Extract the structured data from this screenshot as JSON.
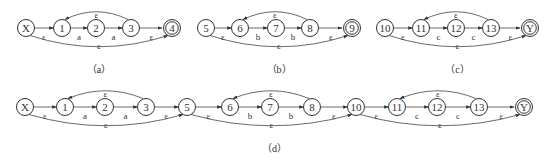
{
  "figure": {
    "panels": [
      {
        "id": "a",
        "caption": "（a）",
        "nodes": [
          {
            "label": "X",
            "x": 26,
            "y": 28,
            "accept": false
          },
          {
            "label": "1",
            "x": 62,
            "y": 28,
            "accept": false
          },
          {
            "label": "2",
            "x": 96,
            "y": 28,
            "accept": false
          },
          {
            "label": "3",
            "x": 131,
            "y": 28,
            "accept": false
          },
          {
            "label": "4",
            "x": 172,
            "y": 28,
            "accept": true
          }
        ],
        "edges": [
          {
            "from": 0,
            "to": 1,
            "label": "ε"
          },
          {
            "from": 1,
            "to": 2,
            "label": "a"
          },
          {
            "from": 2,
            "to": 3,
            "label": "a"
          },
          {
            "from": 3,
            "to": 4,
            "label": "ε"
          }
        ],
        "back_edge": {
          "from": 3,
          "to": 1,
          "label": "ε"
        },
        "skip_edge": {
          "from": 0,
          "to": 4,
          "label": "ε"
        }
      },
      {
        "id": "b",
        "caption": "（b）",
        "nodes": [
          {
            "label": "5",
            "x": 206,
            "y": 28,
            "accept": false
          },
          {
            "label": "6",
            "x": 240,
            "y": 28,
            "accept": false
          },
          {
            "label": "7",
            "x": 276,
            "y": 28,
            "accept": false
          },
          {
            "label": "8",
            "x": 310,
            "y": 28,
            "accept": false
          },
          {
            "label": "9",
            "x": 352,
            "y": 28,
            "accept": true
          }
        ],
        "edges": [
          {
            "from": 0,
            "to": 1,
            "label": "ε"
          },
          {
            "from": 1,
            "to": 2,
            "label": "b"
          },
          {
            "from": 2,
            "to": 3,
            "label": "b"
          },
          {
            "from": 3,
            "to": 4,
            "label": "ε"
          }
        ],
        "back_edge": {
          "from": 3,
          "to": 1,
          "label": "ε"
        },
        "skip_edge": {
          "from": 0,
          "to": 4,
          "label": "ε"
        }
      },
      {
        "id": "c",
        "caption": "（c）",
        "nodes": [
          {
            "label": "10",
            "x": 385,
            "y": 28,
            "accept": false
          },
          {
            "label": "11",
            "x": 421,
            "y": 28,
            "accept": false
          },
          {
            "label": "12",
            "x": 456,
            "y": 28,
            "accept": false
          },
          {
            "label": "13",
            "x": 491,
            "y": 28,
            "accept": false
          },
          {
            "label": "Y",
            "x": 530,
            "y": 28,
            "accept": true
          }
        ],
        "edges": [
          {
            "from": 0,
            "to": 1,
            "label": "ε"
          },
          {
            "from": 1,
            "to": 2,
            "label": "c"
          },
          {
            "from": 2,
            "to": 3,
            "label": "c"
          },
          {
            "from": 3,
            "to": 4,
            "label": "ε"
          }
        ],
        "back_edge": {
          "from": 3,
          "to": 1,
          "label": "ε"
        },
        "skip_edge": {
          "from": 0,
          "to": 4,
          "label": "ε"
        }
      }
    ],
    "combined": {
      "id": "d",
      "caption": "（d）",
      "nodes": [
        {
          "label": "X",
          "x": 25,
          "y": 107,
          "accept": false
        },
        {
          "label": "1",
          "x": 65,
          "y": 107,
          "accept": false
        },
        {
          "label": "2",
          "x": 105,
          "y": 107,
          "accept": false
        },
        {
          "label": "3",
          "x": 146,
          "y": 107,
          "accept": false
        },
        {
          "label": "5",
          "x": 187,
          "y": 107,
          "accept": false
        },
        {
          "label": "6",
          "x": 230,
          "y": 107,
          "accept": false
        },
        {
          "label": "7",
          "x": 270,
          "y": 107,
          "accept": false
        },
        {
          "label": "8",
          "x": 312,
          "y": 107,
          "accept": false
        },
        {
          "label": "10",
          "x": 356,
          "y": 107,
          "accept": false
        },
        {
          "label": "11",
          "x": 397,
          "y": 107,
          "accept": false
        },
        {
          "label": "12",
          "x": 437,
          "y": 107,
          "accept": false
        },
        {
          "label": "13",
          "x": 479,
          "y": 107,
          "accept": false
        },
        {
          "label": "Y",
          "x": 524,
          "y": 107,
          "accept": true
        }
      ],
      "edges": [
        {
          "from": 0,
          "to": 1,
          "label": "ε"
        },
        {
          "from": 1,
          "to": 2,
          "label": "a"
        },
        {
          "from": 2,
          "to": 3,
          "label": "a"
        },
        {
          "from": 3,
          "to": 4,
          "label": "ε"
        },
        {
          "from": 4,
          "to": 5,
          "label": "ε"
        },
        {
          "from": 5,
          "to": 6,
          "label": "b"
        },
        {
          "from": 6,
          "to": 7,
          "label": "b"
        },
        {
          "from": 7,
          "to": 8,
          "label": "ε"
        },
        {
          "from": 8,
          "to": 9,
          "label": "ε"
        },
        {
          "from": 9,
          "to": 10,
          "label": "c"
        },
        {
          "from": 10,
          "to": 11,
          "label": "c"
        },
        {
          "from": 11,
          "to": 12,
          "label": "ε"
        }
      ],
      "back_edges": [
        {
          "from": 3,
          "to": 1,
          "label": "ε"
        },
        {
          "from": 7,
          "to": 5,
          "label": "ε"
        },
        {
          "from": 11,
          "to": 9,
          "label": "ε"
        }
      ],
      "skip_edges": [
        {
          "from": 0,
          "to": 4,
          "label": "ε"
        },
        {
          "from": 4,
          "to": 8,
          "label": "ε"
        },
        {
          "from": 8,
          "to": 12,
          "label": "ε"
        }
      ]
    },
    "captions_y": {
      "top": 73,
      "bottom": 152
    },
    "colors": {
      "stroke": "#333333",
      "background": "#ffffff"
    }
  }
}
